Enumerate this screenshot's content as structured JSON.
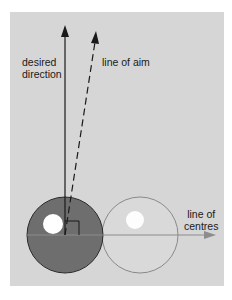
{
  "labels": {
    "desired_direction_1": "desired",
    "desired_direction_2": "direction",
    "line_of_aim": "line of aim",
    "line_of_centres_1": "line of",
    "line_of_centres_2": "centres"
  },
  "colors": {
    "background": "#d6d6d6",
    "cue_ball": "#6e6e6e",
    "object_ball_outline": "#8a8a8a",
    "line": "#1a1a1a",
    "line_of_centres": "#8c8c8c",
    "highlight": "#ffffff"
  }
}
